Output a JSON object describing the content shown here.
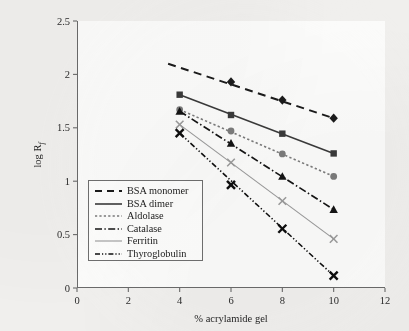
{
  "chart_data": {
    "type": "line",
    "title": "",
    "xlabel": "% acrylamide gel",
    "ylabel": "log Rf",
    "ylabel_main": "log R",
    "ylabel_sub": "f",
    "xlim": [
      0,
      12
    ],
    "ylim": [
      0,
      2.5
    ],
    "xticks": [
      "0",
      "2",
      "4",
      "6",
      "8",
      "10",
      "12"
    ],
    "xtick_values": [
      0,
      2,
      4,
      6,
      8,
      10,
      12
    ],
    "yticks": [
      "0",
      "0.5",
      "1",
      "1.5",
      "2",
      "2.5"
    ],
    "ytick_values": [
      0,
      0.5,
      1,
      1.5,
      2,
      2.5
    ],
    "grid": false,
    "legend_position": "lower-left-inside",
    "x": [
      4,
      6,
      8,
      10
    ],
    "series": [
      {
        "name": "BSA monomer",
        "values": [
          null,
          1.93,
          1.76,
          1.59
        ],
        "line_style": "dashed",
        "marker": "diamond",
        "color": "#1b1b1b",
        "line_start_x": 3.55,
        "line_start_y": 2.1,
        "line_end_x": 10.0,
        "line_end_y": 1.59
      },
      {
        "name": "BSA dimer",
        "values": [
          1.81,
          1.62,
          1.445,
          1.26
        ],
        "line_style": "solid",
        "marker": "square",
        "color": "#3a3a3a",
        "line_start_x": 4.0,
        "line_start_y": 1.81,
        "line_end_x": 10.0,
        "line_end_y": 1.26
      },
      {
        "name": "Aldolase",
        "values": [
          1.67,
          1.47,
          1.255,
          1.045
        ],
        "line_style": "dotted",
        "marker": "circle",
        "color": "#7b7b7b",
        "line_start_x": 4.0,
        "line_start_y": 1.67,
        "line_end_x": 10.0,
        "line_end_y": 1.045
      },
      {
        "name": "Catalase",
        "values": [
          1.655,
          1.355,
          1.045,
          0.735
        ],
        "line_style": "dashdot",
        "marker": "triangle",
        "color": "#141414",
        "line_start_x": 4.0,
        "line_start_y": 1.655,
        "line_end_x": 10.0,
        "line_end_y": 0.735
      },
      {
        "name": "Ferritin",
        "values": [
          1.53,
          1.175,
          0.815,
          0.46
        ],
        "line_style": "solid-thin",
        "marker": "x",
        "color": "#9a9a9a",
        "line_start_x": 4.0,
        "line_start_y": 1.53,
        "line_end_x": 10.0,
        "line_end_y": 0.46
      },
      {
        "name": "Thyroglobulin",
        "values": [
          1.45,
          0.965,
          0.555,
          0.115
        ],
        "line_style": "dashdotdot",
        "marker": "x-bold",
        "color": "#0e0e0e",
        "line_start_x": 4.0,
        "line_start_y": 1.45,
        "line_end_x": 10.0,
        "line_end_y": 0.115
      }
    ]
  },
  "legend": {
    "items": [
      {
        "label": "BSA monomer"
      },
      {
        "label": "BSA dimer"
      },
      {
        "label": "Aldolase"
      },
      {
        "label": "Catalase"
      },
      {
        "label": "Ferritin"
      },
      {
        "label": "Thyroglobulin"
      }
    ]
  }
}
